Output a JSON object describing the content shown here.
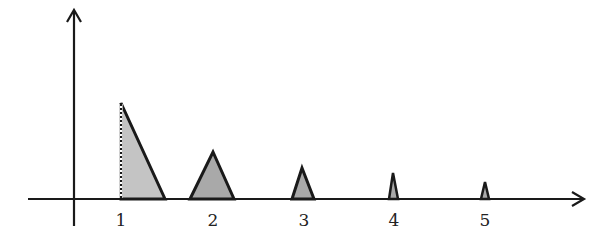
{
  "diagram": {
    "colors": {
      "axis": "#1a1a1a",
      "fill_light": "#c2c2c2",
      "fill_dark": "#a8a8a8",
      "stroke": "#1a1a1a"
    },
    "x_axis": {
      "y": 199,
      "x_start": 28,
      "x_end": 585
    },
    "y_axis": {
      "x": 74,
      "y_start": 225,
      "y_end": 10
    },
    "shapes": [
      {
        "label": "1",
        "type": "right-triangle",
        "points": "121,103 121,199 165,199",
        "label_x": 121
      },
      {
        "label": "2",
        "type": "triangle",
        "points": "190,199 213,152 234,199",
        "label_x": 213
      },
      {
        "label": "3",
        "type": "triangle",
        "points": "292,199 302,168 314,199",
        "label_x": 304
      },
      {
        "label": "4",
        "type": "triangle",
        "points": "389,199 393,173 398,199",
        "label_x": 394
      },
      {
        "label": "5",
        "type": "triangle",
        "points": "481,199 485,182 489,199",
        "label_x": 485
      }
    ],
    "tick_labels": [
      "1",
      "2",
      "3",
      "4",
      "5"
    ]
  }
}
